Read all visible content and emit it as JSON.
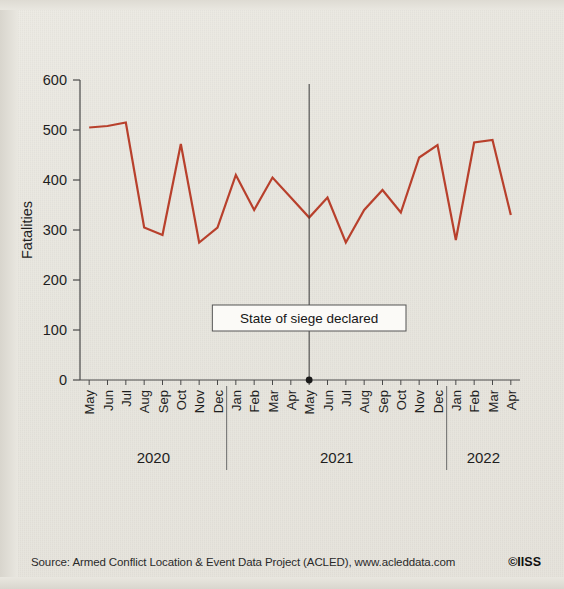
{
  "figure": {
    "source_label": "Source: Armed Conflict Location & Event Data Project (ACLED), www.acleddata.com",
    "credit_label": "©IISS"
  },
  "chart_data": {
    "type": "line",
    "title": "",
    "xlabel": "",
    "ylabel": "Fatalities",
    "ylim": [
      0,
      600
    ],
    "yticks": [
      0,
      100,
      200,
      300,
      400,
      500,
      600
    ],
    "ytick_labels": [
      "0",
      "100",
      "200",
      "300",
      "400",
      "500",
      "600"
    ],
    "grid": false,
    "legend": "none",
    "line_color": "#b8402c",
    "line_width": 2.2,
    "categories": [
      "May",
      "Jun",
      "Jul",
      "Aug",
      "Sep",
      "Oct",
      "Nov",
      "Dec",
      "Jan",
      "Feb",
      "Mar",
      "Apr",
      "May",
      "Jun",
      "Jul",
      "Aug",
      "Sep",
      "Oct",
      "Nov",
      "Dec",
      "Jan",
      "Feb",
      "Mar",
      "Apr"
    ],
    "values": [
      505,
      508,
      515,
      305,
      290,
      472,
      275,
      305,
      410,
      340,
      405,
      365,
      325,
      365,
      275,
      340,
      380,
      335,
      445,
      470,
      280,
      475,
      480,
      330
    ],
    "year_groups": [
      {
        "label": "2020",
        "start_index": 0,
        "end_index": 7
      },
      {
        "label": "2021",
        "start_index": 8,
        "end_index": 19
      },
      {
        "label": "2022",
        "start_index": 20,
        "end_index": 23
      }
    ],
    "annotations": [
      {
        "label": "State of siege declared",
        "at_category_index": 12,
        "at_value": 0,
        "marker": "dot",
        "line_color": "#3a3a3a"
      }
    ]
  }
}
